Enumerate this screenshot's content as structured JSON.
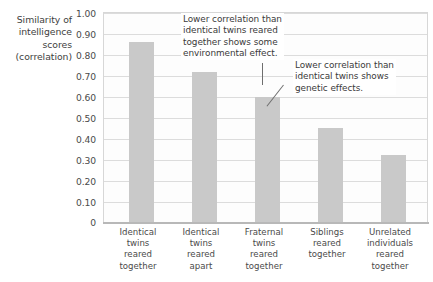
{
  "chart_data": {
    "type": "bar",
    "title": "",
    "xlabel": "",
    "ylabel": "Similarity of intelligence scores (correlation)",
    "ylabel_lines": [
      "Similarity of",
      "intelligence",
      "scores",
      "(correlation)"
    ],
    "ylim": [
      0,
      1.0
    ],
    "ytick_labels": [
      "1.00",
      "0.90",
      "0.80",
      "0.70",
      "0.60",
      "0.50",
      "0.40",
      "0.30",
      "0.20",
      "0.10",
      "0"
    ],
    "ytick_values": [
      1.0,
      0.9,
      0.8,
      0.7,
      0.6,
      0.5,
      0.4,
      0.3,
      0.2,
      0.1,
      0
    ],
    "grid": true,
    "legend": "none",
    "bar_color": "#c9c9c9",
    "categories": [
      "Identical twins reared together",
      "Identical twins reared apart",
      "Fraternal twins reared together",
      "Siblings reared together",
      "Unrelated individuals reared together"
    ],
    "category_lines": [
      [
        "Identical",
        "twins",
        "reared",
        "together"
      ],
      [
        "Identical",
        "twins",
        "reared",
        "apart"
      ],
      [
        "Fraternal",
        "twins",
        "reared",
        "together"
      ],
      [
        "Siblings",
        "reared",
        "together"
      ],
      [
        "Unrelated",
        "individuals",
        "reared",
        "together"
      ]
    ],
    "values": [
      0.86,
      0.72,
      0.6,
      0.45,
      0.32
    ],
    "annotations": [
      {
        "id": "environmental",
        "lines": [
          "Lower correlation than",
          "identical twins reared",
          "together shows some",
          "environmental effect."
        ],
        "text": "Lower correlation than identical twins reared together shows some environmental effect.",
        "points_to": "Identical twins reared apart"
      },
      {
        "id": "genetic",
        "lines": [
          "Lower correlation than",
          "identical twins shows",
          "genetic effects."
        ],
        "text": "Lower correlation than identical twins shows genetic effects.",
        "points_to": "Fraternal twins reared together"
      }
    ]
  }
}
